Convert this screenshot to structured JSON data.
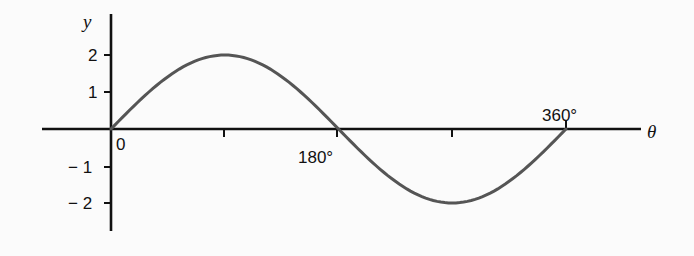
{
  "chart_data": {
    "type": "line",
    "title": "",
    "xlabel": "θ",
    "ylabel": "y",
    "function": "y = 2 sin θ",
    "x_unit": "degrees",
    "xlim": [
      0,
      360
    ],
    "ylim": [
      -2.5,
      2.5
    ],
    "grid": false,
    "legend": null,
    "x_ticks": [
      0,
      90,
      180,
      270,
      360
    ],
    "x_tick_labels": [
      "0",
      "",
      "180°",
      "",
      "360°"
    ],
    "y_ticks": [
      2,
      1,
      -1,
      -2
    ],
    "y_tick_labels": [
      "2",
      "1",
      "− 1",
      "− 2"
    ],
    "series": [
      {
        "name": "y = 2 sin θ",
        "color": "#555555",
        "x": [
          0,
          30,
          60,
          90,
          120,
          150,
          180,
          210,
          240,
          270,
          300,
          330,
          360
        ],
        "values": [
          0,
          1,
          1.73,
          2,
          1.73,
          1,
          0,
          -1,
          -1.73,
          -2,
          -1.73,
          -1,
          0
        ]
      }
    ]
  },
  "labels": {
    "y_axis": "y",
    "x_axis": "θ",
    "origin": "0",
    "x180": "180°",
    "x360": "360°",
    "y2": "2",
    "y1": "1",
    "yneg1": "− 1",
    "yneg2": "− 2"
  }
}
